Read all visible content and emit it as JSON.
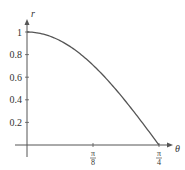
{
  "chart_data": {
    "type": "line",
    "title": "",
    "xlabel": "θ",
    "ylabel": "r",
    "function": "r = cos(2θ)",
    "x": [
      0,
      0.0982,
      0.1963,
      0.2945,
      0.3927,
      0.4909,
      0.589,
      0.6872,
      0.7854
    ],
    "x_labels": [
      "0",
      "π/32",
      "π/16",
      "3π/32",
      "π/8",
      "5π/32",
      "3π/16",
      "7π/32",
      "π/4"
    ],
    "series": [
      {
        "name": "r = cos(2θ)",
        "values": [
          1.0,
          0.981,
          0.924,
          0.831,
          0.707,
          0.556,
          0.383,
          0.195,
          0.0
        ],
        "color": "#555555"
      }
    ],
    "xlim": [
      0,
      0.8378
    ],
    "ylim": [
      0,
      1.1
    ],
    "x_ticks": [
      {
        "value": 0.3927,
        "label_num": "π",
        "label_den": "8"
      },
      {
        "value": 0.7854,
        "label_num": "π",
        "label_den": "4"
      }
    ],
    "y_ticks": [
      {
        "value": 0.2,
        "label": "0.2"
      },
      {
        "value": 0.4,
        "label": "0.4"
      },
      {
        "value": 0.6,
        "label": "0.6"
      },
      {
        "value": 0.8,
        "label": "0.8"
      },
      {
        "value": 1,
        "label": "1"
      }
    ],
    "grid": false,
    "legend": null
  },
  "axes": {
    "x_label": "θ",
    "y_label": "r"
  }
}
